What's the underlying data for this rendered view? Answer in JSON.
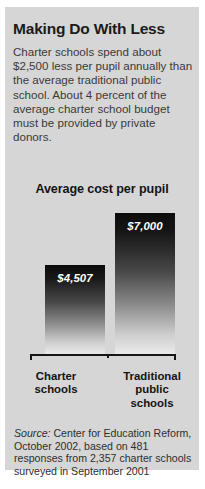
{
  "headline": "Making Do With Less",
  "deck": "Charter schools spend about $2,500 less per pupil annually than the average traditional public school. About 4 percent of the average charter school budget must be provided by private donors.",
  "source": {
    "label": "Source:",
    "text": " Center for Education Reform, October 2002, based on 481 responses from 2,357 charter schools surveyed in September 2001"
  },
  "colors": {
    "panel_background": "#d6d6d6",
    "bar_top": "#0c0c0c",
    "bar_bottom": "#ececec",
    "text": "#1b1b1b",
    "axis": "#151515",
    "value_label": "#ffffff"
  },
  "chart_data": {
    "type": "bar",
    "title": "Average cost per pupil",
    "xlabel": "",
    "ylabel": "",
    "grid": false,
    "legend": "none",
    "categories": [
      "Charter schools",
      "Traditional public schools"
    ],
    "category_lines": [
      [
        "Charter",
        "schools"
      ],
      [
        "Traditional",
        "public",
        "schools"
      ]
    ],
    "values": [
      4507,
      7000
    ],
    "value_labels": [
      "$4,507",
      "$7,000"
    ],
    "ylim": [
      0,
      7000
    ],
    "units": "US dollars per pupil per year"
  }
}
